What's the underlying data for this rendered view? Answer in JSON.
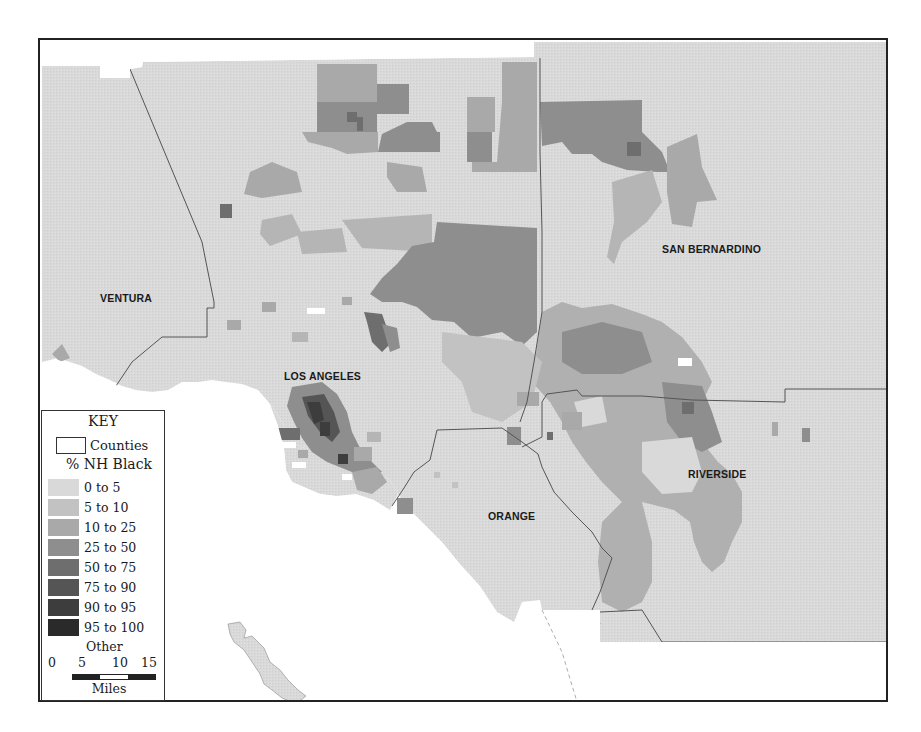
{
  "map": {
    "title": "% NH Black by census tract, Los Angeles region",
    "background_land_color": "#d9d9d9",
    "water_color": "#ffffff",
    "county_border_color": "#555555",
    "counties": [
      {
        "name": "VENTURA",
        "label_x": 98,
        "label_y": 290
      },
      {
        "name": "LOS ANGELES",
        "label_x": 283,
        "label_y": 368
      },
      {
        "name": "SAN BERNARDINO",
        "label_x": 661,
        "label_y": 241
      },
      {
        "name": "RIVERSIDE",
        "label_x": 686,
        "label_y": 465
      },
      {
        "name": "ORANGE",
        "label_x": 487,
        "label_y": 508
      }
    ]
  },
  "legend": {
    "title": "KEY",
    "counties_label": "Counties",
    "variable_title": "% NH Black",
    "classes": [
      {
        "label": "0 to 5",
        "color": "#d9d9d9"
      },
      {
        "label": "5 to 10",
        "color": "#c2c2c2"
      },
      {
        "label": "10 to 25",
        "color": "#a9a9a9"
      },
      {
        "label": "25 to 50",
        "color": "#8e8e8e"
      },
      {
        "label": "50 to 75",
        "color": "#6e6e6e"
      },
      {
        "label": "75 to 90",
        "color": "#555555"
      },
      {
        "label": "90 to 95",
        "color": "#3d3d3d"
      },
      {
        "label": "95 to 100",
        "color": "#2a2a2a"
      }
    ],
    "other_label": "Other",
    "scale": {
      "ticks": [
        "0",
        "5",
        "10",
        "15"
      ],
      "unit": "Miles"
    }
  }
}
